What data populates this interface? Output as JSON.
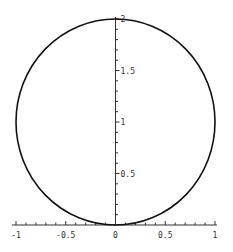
{
  "chart_data": {
    "type": "line",
    "title": "",
    "xlabel": "",
    "ylabel": "",
    "xlim": [
      -1,
      1
    ],
    "ylim": [
      0,
      2
    ],
    "grid": false,
    "legend": null,
    "x_ticks": [
      {
        "value": -1,
        "label": "-1"
      },
      {
        "value": -0.5,
        "label": "-0.5"
      },
      {
        "value": 0,
        "label": "0"
      },
      {
        "value": 0.5,
        "label": "0.5"
      },
      {
        "value": 1,
        "label": "1"
      }
    ],
    "y_ticks": [
      {
        "value": 0.5,
        "label": "0.5"
      },
      {
        "value": 1,
        "label": "1"
      },
      {
        "value": 1.5,
        "label": "1.5"
      },
      {
        "value": 2,
        "label": "2"
      }
    ],
    "series": [
      {
        "name": "circle",
        "description": "x^2 + (y-1)^2 = 1",
        "center": [
          0,
          1
        ],
        "radius": 1,
        "color": "#111111"
      }
    ]
  }
}
